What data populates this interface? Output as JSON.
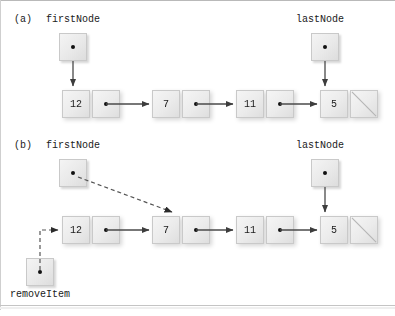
{
  "figure": {
    "panels": [
      {
        "id": "a",
        "label": "(a)",
        "caption_before": "before removal",
        "pointers": [
          {
            "name": "firstNode",
            "label": "firstNode",
            "target": "node-12"
          },
          {
            "name": "lastNode",
            "label": "lastNode",
            "target": "node-5"
          }
        ],
        "nodes": [
          {
            "id": "node-12",
            "value": "12",
            "link": "dot"
          },
          {
            "id": "node-7",
            "value": "7",
            "link": "dot"
          },
          {
            "id": "node-11",
            "value": "11",
            "link": "dot"
          },
          {
            "id": "node-5",
            "value": "5",
            "link": "null"
          }
        ],
        "arrow_style": "solid"
      },
      {
        "id": "b",
        "label": "(b)",
        "caption_before": "after removal of first node",
        "pointers": [
          {
            "name": "firstNode",
            "label": "firstNode",
            "target": "node-7"
          },
          {
            "name": "lastNode",
            "label": "lastNode",
            "target": "node-5"
          },
          {
            "name": "removeItem",
            "label": "removeItem",
            "target": "node-12"
          }
        ],
        "nodes": [
          {
            "id": "node-12",
            "value": "12",
            "link": "dot"
          },
          {
            "id": "node-7",
            "value": "7",
            "link": "dot"
          },
          {
            "id": "node-11",
            "value": "11",
            "link": "dot"
          },
          {
            "id": "node-5",
            "value": "5",
            "link": "null"
          }
        ],
        "arrow_style": "mixed-dashed-solid"
      }
    ],
    "colors": {
      "node_fill_light": "#f5f5f5",
      "node_fill_dark": "#dedede",
      "node_border": "#c9c9c9",
      "arrow": "#4a4a4a",
      "dot": "#111111",
      "text": "#1a1a1a",
      "frame": "#b9b9b9",
      "background": "#ffffff"
    }
  }
}
